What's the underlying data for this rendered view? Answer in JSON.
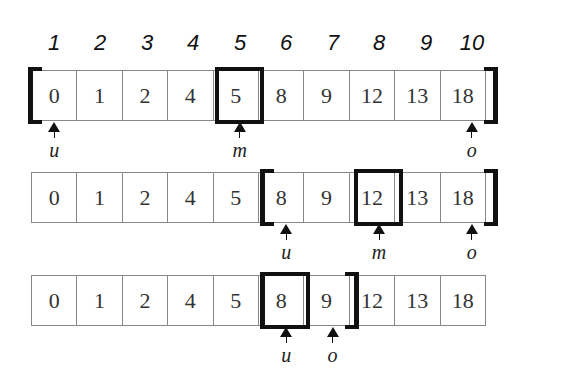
{
  "indices": [
    "1",
    "2",
    "3",
    "4",
    "5",
    "6",
    "7",
    "8",
    "9",
    "10"
  ],
  "array": [
    "0",
    "1",
    "2",
    "4",
    "5",
    "8",
    "9",
    "12",
    "13",
    "18"
  ],
  "steps": [
    {
      "row_top": 70,
      "left_bracket": 0,
      "right_bracket": 9,
      "mid": 4,
      "pointers": [
        {
          "label": "u",
          "pos": 0
        },
        {
          "label": "m",
          "pos": 4
        },
        {
          "label": "o",
          "pos": 9
        }
      ]
    },
    {
      "row_top": 172,
      "left_bracket": 5,
      "right_bracket": 9,
      "mid": 7,
      "pointers": [
        {
          "label": "u",
          "pos": 5
        },
        {
          "label": "m",
          "pos": 7
        },
        {
          "label": "o",
          "pos": 9
        }
      ]
    },
    {
      "row_top": 275,
      "left_bracket": 5,
      "right_bracket": 6,
      "mid": 5,
      "pointers": [
        {
          "label": "u",
          "pos": 5
        },
        {
          "label": "o",
          "pos": 6
        }
      ]
    }
  ]
}
